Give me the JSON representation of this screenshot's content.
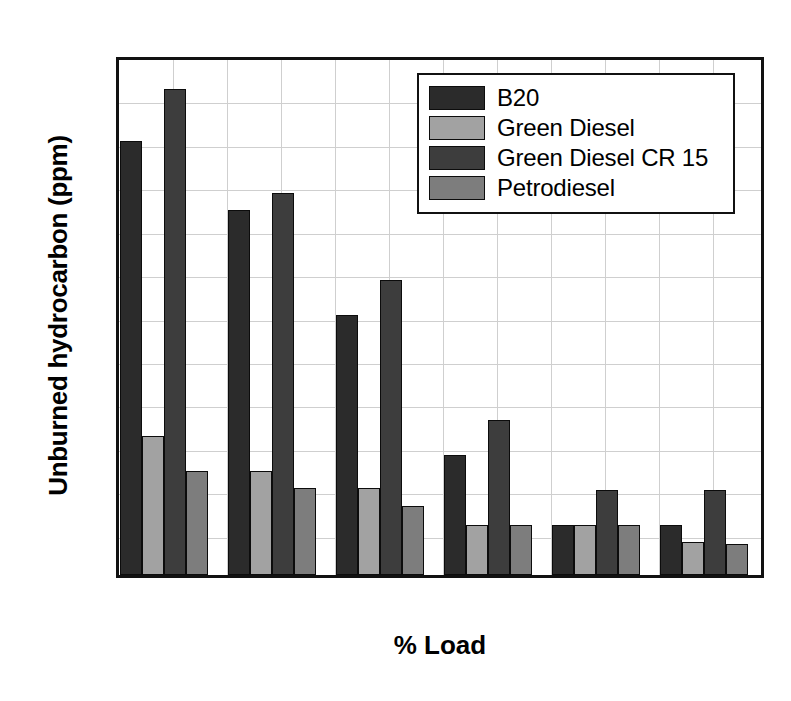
{
  "chart_data": {
    "type": "bar",
    "title": "",
    "xlabel": "% Load",
    "ylabel": "Unburned hydrocarbon (ppm)",
    "categories": [
      "0",
      "20",
      "40",
      "60",
      "80",
      "100"
    ],
    "xlim": [
      -10,
      110
    ],
    "ylim": [
      0,
      30
    ],
    "yticks": [
      0,
      5,
      10,
      15,
      20,
      25,
      30
    ],
    "yticks_minor": [
      2.5,
      7.5,
      12.5,
      17.5,
      22.5,
      27.5
    ],
    "xticks": [
      0,
      20,
      40,
      60,
      80,
      100
    ],
    "xticks_minor": [
      10,
      30,
      50,
      70,
      90
    ],
    "grid": true,
    "legend_position": "top-right",
    "series": [
      {
        "name": "B20",
        "color": "#2b2b2b",
        "values": [
          25,
          21,
          15,
          6.9,
          2.9,
          2.9
        ]
      },
      {
        "name": "Green Diesel",
        "color": "#a2a2a2",
        "values": [
          8,
          6,
          5,
          2.9,
          2.9,
          1.9
        ]
      },
      {
        "name": "Green Diesel CR 15",
        "color": "#3d3d3d",
        "values": [
          28,
          22,
          17,
          8.9,
          4.9,
          4.9
        ]
      },
      {
        "name": "Petrodiesel",
        "color": "#7d7d7d",
        "values": [
          6,
          5,
          4,
          2.9,
          2.9,
          1.8
        ]
      }
    ]
  }
}
